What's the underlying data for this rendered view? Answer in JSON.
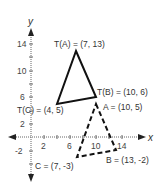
{
  "axes": {
    "x_label": "x",
    "y_label": "y",
    "x_ticks": [
      "2",
      "6",
      "10",
      "14"
    ],
    "y_ticks": [
      "14",
      "10",
      "6",
      "2",
      "-2"
    ]
  },
  "image_triangle": {
    "style": "solid",
    "vertices": [
      {
        "name": "T(A)",
        "x": 7,
        "y": 13,
        "label": "T(A) = (7, 13)"
      },
      {
        "name": "T(B)",
        "x": 10,
        "y": 6,
        "label": "T(B) = (10, 6)"
      },
      {
        "name": "T(C)",
        "x": 4,
        "y": 5,
        "label": "T(C) = (4, 5)"
      }
    ]
  },
  "preimage_triangle": {
    "style": "dashed",
    "vertices": [
      {
        "name": "A",
        "x": 10,
        "y": 5,
        "label": "A = (10, 5)"
      },
      {
        "name": "B",
        "x": 13,
        "y": -2,
        "label": "B = (13, -2)"
      },
      {
        "name": "C",
        "x": 7,
        "y": -3,
        "label": "C = (7, -3)"
      }
    ]
  },
  "colors": {
    "line": "#111111",
    "axis": "#444444",
    "text": "#333333"
  }
}
